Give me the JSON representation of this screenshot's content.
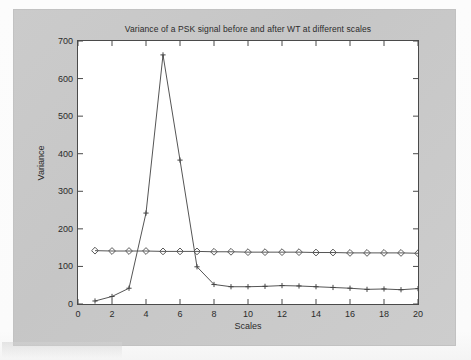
{
  "chart_data": {
    "type": "line",
    "title": "Variance of a PSK signal before and after WT at different scales",
    "xlabel": "Scales",
    "ylabel": "Variance",
    "xlim": [
      0,
      20
    ],
    "ylim": [
      0,
      700
    ],
    "xticks": [
      0,
      2,
      4,
      6,
      8,
      10,
      12,
      14,
      16,
      18,
      20
    ],
    "yticks": [
      0,
      100,
      200,
      300,
      400,
      500,
      600,
      700
    ],
    "grid": false,
    "legend": "none",
    "x": [
      1,
      2,
      3,
      4,
      5,
      6,
      7,
      8,
      9,
      10,
      11,
      12,
      13,
      14,
      15,
      16,
      17,
      18,
      19,
      20
    ],
    "series": [
      {
        "name": "Variance before WT",
        "marker": "diamond",
        "color": "#5a5a5a",
        "values": [
          142,
          141,
          141,
          141,
          140,
          140,
          140,
          139,
          139,
          138,
          138,
          138,
          138,
          137,
          137,
          136,
          136,
          136,
          136,
          135
        ]
      },
      {
        "name": "Variance after WT",
        "marker": "plus",
        "color": "#444444",
        "values": [
          8,
          20,
          42,
          242,
          663,
          383,
          99,
          52,
          46,
          46,
          47,
          49,
          48,
          46,
          44,
          42,
          39,
          40,
          38,
          41
        ]
      }
    ]
  },
  "figure": {
    "background_color": "#c9c9c9",
    "axes_background_color": "#ffffff",
    "axes_edge_color": "#4a4a4a"
  }
}
